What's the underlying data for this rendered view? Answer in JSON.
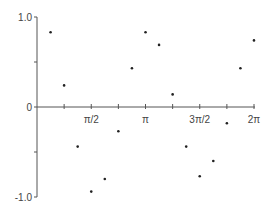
{
  "chart_data": {
    "type": "scatter",
    "title": "",
    "xlabel": "",
    "ylabel": "",
    "xlim": [
      0,
      6.2832
    ],
    "ylim": [
      -1.0,
      1.0
    ],
    "grid": false,
    "legend": null,
    "x_ticks": [
      {
        "value": 0.7854,
        "label": ""
      },
      {
        "value": 1.5708,
        "label": "π/2"
      },
      {
        "value": 2.3562,
        "label": ""
      },
      {
        "value": 3.1416,
        "label": "π"
      },
      {
        "value": 3.927,
        "label": ""
      },
      {
        "value": 4.7124,
        "label": "3π/2"
      },
      {
        "value": 5.4978,
        "label": ""
      },
      {
        "value": 6.2832,
        "label": "2π"
      }
    ],
    "y_ticks": [
      {
        "value": 1.0,
        "label": "1.0"
      },
      {
        "value": 0.5,
        "label": ""
      },
      {
        "value": 0.0,
        "label": "0"
      },
      {
        "value": -0.5,
        "label": ""
      },
      {
        "value": -1.0,
        "label": "-1.0"
      }
    ],
    "x": [
      0.393,
      0.785,
      1.178,
      1.571,
      1.963,
      2.356,
      2.749,
      3.142,
      3.534,
      3.927,
      4.32,
      4.712,
      5.105,
      5.498,
      5.89,
      6.283
    ],
    "y": [
      0.83,
      0.24,
      -0.44,
      -0.94,
      -0.8,
      -0.27,
      0.43,
      0.83,
      0.69,
      0.14,
      -0.44,
      -0.77,
      -0.6,
      -0.18,
      0.43,
      0.74
    ]
  },
  "colors": {
    "axis": "#555555",
    "point": "#222222",
    "label": "#444444"
  }
}
